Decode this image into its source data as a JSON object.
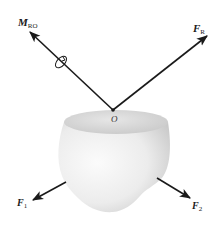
{
  "diagram": {
    "title": "",
    "colors": {
      "arrow": "#1a1a1a",
      "body_light": "#f4f4f4",
      "body_shade": "#cfcfcf",
      "body_top": "#d8d8d8"
    },
    "point": {
      "label": "O"
    },
    "vectors": [
      {
        "id": "M_RO",
        "main": "M",
        "sub": "RO",
        "kind": "couple-moment",
        "icon": "circular-rotation-icon"
      },
      {
        "id": "F_R",
        "main": "F",
        "sub": "R",
        "kind": "resultant-force"
      },
      {
        "id": "F_1",
        "main": "F",
        "sub": "1",
        "kind": "force"
      },
      {
        "id": "F_2",
        "main": "F",
        "sub": "2",
        "kind": "force"
      }
    ]
  }
}
